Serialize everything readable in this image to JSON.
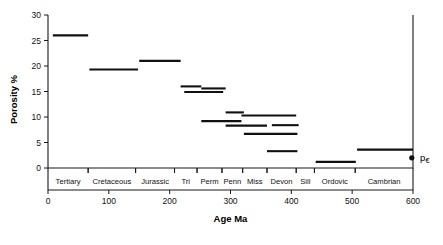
{
  "chart_data": {
    "type": "bar",
    "title": "",
    "xlabel": "Age  Ma",
    "ylabel": "Porosity  %",
    "xlim": [
      0,
      600
    ],
    "ylim": [
      0,
      30
    ],
    "grid": false,
    "legend": null,
    "xticks": [
      0,
      100,
      200,
      300,
      400,
      500,
      600
    ],
    "xtick_labels": [
      "0",
      "100",
      "200",
      "300",
      "400",
      "500",
      "600"
    ],
    "yticks": [
      0,
      5,
      10,
      15,
      20,
      25,
      30
    ],
    "ytick_labels": [
      "0",
      "5",
      "10",
      "15",
      "20",
      "25",
      "30"
    ],
    "series": [
      {
        "name": "Mean porosity by geologic period",
        "values": [
          26.0,
          19.3,
          21.0,
          16.0,
          14.9,
          15.6,
          9.2,
          10.9,
          8.3,
          10.3,
          6.7,
          8.4,
          3.3,
          1.2,
          3.6
        ],
        "x_start": [
          8,
          68,
          150,
          218,
          224,
          252,
          252,
          292,
          292,
          318,
          322,
          368,
          360,
          440,
          508
        ],
        "x_end": [
          66,
          148,
          218,
          252,
          288,
          292,
          318,
          322,
          360,
          408,
          410,
          412,
          410,
          506,
          600
        ]
      }
    ],
    "segments": [
      {
        "label": "Tertiary",
        "x_start": 8,
        "x_end": 66,
        "porosity": 26.0
      },
      {
        "label": "Cretaceous",
        "x_start": 68,
        "x_end": 148,
        "porosity": 19.3
      },
      {
        "label": "Jurassic",
        "x_start": 150,
        "x_end": 218,
        "porosity": 21.0
      },
      {
        "label": "Triassic upper",
        "x_start": 218,
        "x_end": 252,
        "porosity": 16.0
      },
      {
        "label": "Triassic lower",
        "x_start": 224,
        "x_end": 288,
        "porosity": 14.9
      },
      {
        "label": "Permian",
        "x_start": 252,
        "x_end": 292,
        "porosity": 15.6
      },
      {
        "label": "Permian lower",
        "x_start": 252,
        "x_end": 318,
        "porosity": 9.2
      },
      {
        "label": "Pennsylvanian upper",
        "x_start": 292,
        "x_end": 322,
        "porosity": 10.9
      },
      {
        "label": "Pennsylvanian lower",
        "x_start": 292,
        "x_end": 360,
        "porosity": 8.3
      },
      {
        "label": "Mississippian",
        "x_start": 318,
        "x_end": 408,
        "porosity": 10.3
      },
      {
        "label": "Mississippian lower",
        "x_start": 322,
        "x_end": 410,
        "porosity": 6.7
      },
      {
        "label": "Silurian",
        "x_start": 368,
        "x_end": 412,
        "porosity": 8.4
      },
      {
        "label": "Devonian",
        "x_start": 360,
        "x_end": 410,
        "porosity": 3.3
      },
      {
        "label": "Ordovician",
        "x_start": 440,
        "x_end": 506,
        "porosity": 1.2
      },
      {
        "label": "Cambrian",
        "x_start": 508,
        "x_end": 600,
        "porosity": 3.6
      }
    ],
    "point_markers": [
      {
        "label": "Precambrian",
        "x": 598,
        "y": 2.0
      }
    ],
    "annotations": [
      {
        "text": "p",
        "subscript": "€",
        "x": 600,
        "y": 2.0
      }
    ],
    "era_bands": [
      {
        "label": "Tertiary",
        "start": 0,
        "end": 66
      },
      {
        "label": "Cretaceous",
        "start": 66,
        "end": 144
      },
      {
        "label": "Jurassic",
        "start": 144,
        "end": 208
      },
      {
        "label": "Tri",
        "start": 208,
        "end": 245
      },
      {
        "label": "Perm",
        "start": 245,
        "end": 286
      },
      {
        "label": "Penn",
        "start": 286,
        "end": 320
      },
      {
        "label": "Miss",
        "start": 320,
        "end": 360
      },
      {
        "label": "Devon",
        "start": 360,
        "end": 408
      },
      {
        "label": "Sill",
        "start": 408,
        "end": 438
      },
      {
        "label": "Ordovic",
        "start": 438,
        "end": 505
      },
      {
        "label": "Cambrian",
        "start": 505,
        "end": 600
      }
    ]
  }
}
